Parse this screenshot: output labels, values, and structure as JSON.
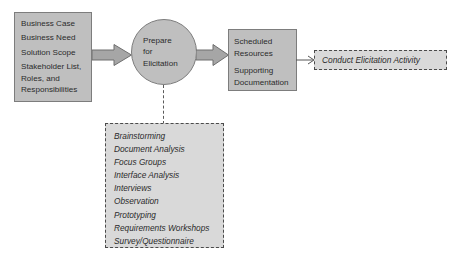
{
  "diagram": {
    "title": "Prepare for Elicitation",
    "colors": {
      "solid_fill": "#bfbfbf",
      "solid_border": "#7d7d7d",
      "dashed_fill": "#d9d9d9",
      "dashed_border": "#4a4a4a",
      "arrow_fill": "#a6a6a6",
      "arrow_border": "#6e6e6e",
      "background": "#ffffff",
      "text": "#2b2b2b"
    },
    "inputs": {
      "items": [
        "Business Case",
        "Business Need",
        "Solution Scope"
      ],
      "wrapped_item": {
        "line1": "Stakeholder List,",
        "line2": "Roles, and",
        "line3": "Responsibilities"
      }
    },
    "task": {
      "line1": "Prepare",
      "line2": "for",
      "line3": "Elicitation"
    },
    "outputs": {
      "group1": {
        "line1": "Scheduled",
        "line2": "Resources"
      },
      "group2": {
        "line1": "Supporting",
        "line2": "Documentation"
      }
    },
    "downstream_activity": {
      "label": "Conduct Elicitation Activity"
    },
    "techniques": {
      "items": [
        "Brainstorming",
        "Document Analysis",
        "Focus Groups",
        "Interface Analysis",
        "Interviews",
        "Observation",
        "Prototyping",
        "Requirements Workshops",
        "Survey/Questionnaire"
      ]
    }
  }
}
